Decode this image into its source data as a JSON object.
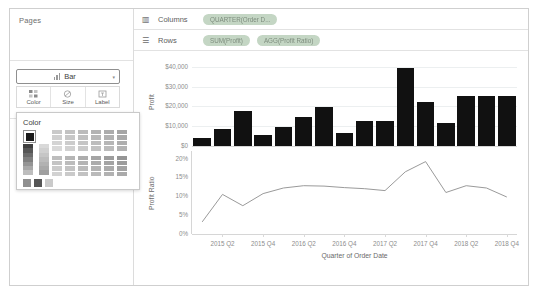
{
  "panels": {
    "pages": {
      "title": "Pages"
    },
    "filters": {
      "title": "Filters"
    },
    "marks": {
      "title": "Marks",
      "caret": "⌄",
      "all_label": "All",
      "all_caret": "⌄",
      "measure_label": "SUM(Profit)",
      "measure_caret": "⌃",
      "mark_type": "Bar",
      "mark_type_caret": "▾",
      "buttons": [
        {
          "label": "Color",
          "icon": "color-palette-icon"
        },
        {
          "label": "Size",
          "icon": "size-icon"
        },
        {
          "label": "Label",
          "icon": "label-icon"
        }
      ]
    },
    "color_popover": {
      "title": "Color",
      "selected_color": "#1a1a1a",
      "ramp_left": [
        "#3f3f3f",
        "#565656",
        "#6b6b6b",
        "#7f7f7f",
        "#949494",
        "#a8a8a8",
        "#bdbdbd"
      ],
      "ramp_second": [
        "#d9d9d9",
        "#d0d0d0",
        "#c6c6c6",
        "#bcbcbc",
        "#b2b2b2",
        "#a9a9a9",
        "#9f9f9f"
      ],
      "grid_top": [
        [
          "#c9c9c9",
          "#c2c2c2",
          "#bbbbbb",
          "#b3b3b3",
          "#acacac",
          "#a5a5a5"
        ],
        [
          "#cfcfcf",
          "#c7c7c7",
          "#c0c0c0",
          "#b8b8b8",
          "#b1b1b1",
          "#a9a9a9"
        ],
        [
          "#d4d4d4",
          "#cccccc",
          "#c5c5c5",
          "#bdbdbd",
          "#b6b6b6",
          "#aeaeae"
        ],
        [
          "#d9d9d9",
          "#d1d1d1",
          "#cacaca",
          "#c2c2c2",
          "#bbbbbb",
          "#b3b3b3"
        ]
      ],
      "grid_bottom": [
        [
          "#bdbdbd",
          "#b5b5b5",
          "#adadad",
          "#a5a5a5",
          "#9d9d9d",
          "#959595"
        ],
        [
          "#c4c4c4",
          "#bcbcbc",
          "#b4b4b4",
          "#acacac",
          "#a4a4a4",
          "#9c9c9c"
        ],
        [
          "#cbcbcb",
          "#c3c3c3",
          "#bbbbbb",
          "#b3b3b3",
          "#ababab",
          "#a3a3a3"
        ],
        [
          "#d2d2d2",
          "#cacaca",
          "#c2c2c2",
          "#bababa",
          "#b2b2b2",
          "#aaaaaa"
        ]
      ],
      "footer_swatches": [
        "#8f8f8f",
        "#555555",
        "#cacaca"
      ]
    }
  },
  "shelves": {
    "columns": {
      "icon": "columns-icon",
      "label": "Columns",
      "pills": [
        "QUARTER(Order D..."
      ]
    },
    "rows": {
      "icon": "rows-icon",
      "label": "Rows",
      "pills": [
        "SUM(Profit)",
        "AGG(Profit Ratio)"
      ]
    }
  },
  "chart_data": [
    {
      "type": "bar",
      "title": "",
      "xlabel": "Quarter of Order Date",
      "ylabel": "Profit",
      "ylim": [
        0,
        45000
      ],
      "yticks": [
        0,
        10000,
        20000,
        30000,
        40000
      ],
      "ytick_labels": [
        "$0",
        "$10,000",
        "$20,000",
        "$30,000",
        "$40,000"
      ],
      "grid": true,
      "color": "#111111",
      "categories": [
        "2015 Q1",
        "2015 Q2",
        "2015 Q3",
        "2015 Q4",
        "2016 Q1",
        "2016 Q2",
        "2016 Q3",
        "2016 Q4",
        "2017 Q1",
        "2017 Q2",
        "2017 Q3",
        "2017 Q4",
        "2018 Q1",
        "2018 Q2",
        "2018 Q3",
        "2018 Q4"
      ],
      "values": [
        4000,
        8500,
        17500,
        5500,
        9500,
        14500,
        19500,
        6500,
        12500,
        12500,
        39500,
        22500,
        11500,
        25500,
        25500,
        25500
      ],
      "xtick_labels": [
        "2015 Q2",
        "2015 Q4",
        "2016 Q2",
        "2016 Q4",
        "2017 Q2",
        "2017 Q4",
        "2018 Q2",
        "2018 Q4"
      ]
    },
    {
      "type": "line",
      "title": "",
      "xlabel": "Quarter of Order Date",
      "ylabel": "Profit Ratio",
      "ylim": [
        0,
        0.22
      ],
      "yticks": [
        0,
        0.05,
        0.1,
        0.15,
        0.2
      ],
      "ytick_labels": [
        "0%",
        "5%",
        "10%",
        "15%",
        "20%"
      ],
      "grid": false,
      "color": "#9a9a9a",
      "categories": [
        "2015 Q1",
        "2015 Q2",
        "2015 Q3",
        "2015 Q4",
        "2016 Q1",
        "2016 Q2",
        "2016 Q3",
        "2016 Q4",
        "2017 Q1",
        "2017 Q2",
        "2017 Q3",
        "2017 Q4",
        "2018 Q1",
        "2018 Q2",
        "2018 Q3",
        "2018 Q4"
      ],
      "values": [
        0.032,
        0.105,
        0.075,
        0.107,
        0.122,
        0.128,
        0.127,
        0.123,
        0.12,
        0.115,
        0.165,
        0.192,
        0.11,
        0.128,
        0.122,
        0.098
      ],
      "xtick_labels": [
        "2015 Q2",
        "2015 Q4",
        "2016 Q2",
        "2016 Q4",
        "2017 Q2",
        "2017 Q4",
        "2018 Q2",
        "2018 Q4"
      ]
    }
  ]
}
